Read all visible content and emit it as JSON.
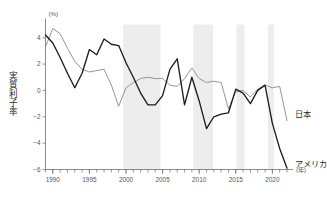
{
  "chart_data": {
    "type": "line",
    "title": "",
    "subtitle": "",
    "xlabel": "(年)",
    "ylabel": "実質利子率",
    "yunit": "(%)",
    "xlim": [
      1989,
      2022
    ],
    "ylim": [
      -6,
      5
    ],
    "yticks": [
      4,
      2,
      0,
      -2,
      -4,
      -6
    ],
    "ytick_labels": [
      "4",
      "2",
      "0",
      "−2",
      "−4",
      "−6"
    ],
    "xticks": [
      1990,
      1995,
      2000,
      2005,
      2010,
      2015,
      2020
    ],
    "xtick_labels": [
      "1990",
      "1995",
      "2000",
      "2005",
      "2010",
      "2015",
      "2020"
    ],
    "grid": false,
    "legend_position": "right-inline",
    "x": [
      1989,
      1990,
      1991,
      1992,
      1993,
      1994,
      1995,
      1996,
      1997,
      1998,
      1999,
      2000,
      2001,
      2002,
      2003,
      2004,
      2005,
      2006,
      2007,
      2008,
      2009,
      2010,
      2011,
      2012,
      2013,
      2014,
      2015,
      2016,
      2017,
      2018,
      2019,
      2020,
      2021,
      2022
    ],
    "series": [
      {
        "name": "日本",
        "label": "日本",
        "color": "#8a8a8a",
        "style": "thin-gray",
        "values": [
          3.3,
          4.7,
          4.3,
          3.2,
          2.2,
          1.6,
          1.4,
          1.5,
          1.6,
          0.4,
          -1.2,
          0.2,
          0.6,
          0.9,
          1.0,
          0.9,
          0.9,
          0.4,
          0.3,
          0.9,
          1.7,
          0.9,
          0.6,
          0.7,
          0.6,
          -1.4,
          -0.1,
          0.0,
          -0.5,
          0.1,
          0.4,
          0.2,
          0.3,
          -2.3
        ]
      },
      {
        "name": "アメリカ",
        "label": "アメリカ",
        "color": "#1d1d1d",
        "style": "thick-black",
        "values": [
          4.2,
          3.6,
          2.5,
          1.3,
          0.2,
          1.3,
          3.1,
          2.7,
          3.9,
          3.5,
          3.4,
          2.1,
          1.0,
          -0.2,
          -1.1,
          -1.1,
          -0.4,
          1.6,
          2.4,
          -1.1,
          1.0,
          -0.8,
          -2.9,
          -2.0,
          -1.8,
          -1.7,
          0.1,
          -0.2,
          -1.0,
          0.0,
          0.4,
          -2.5,
          -4.4,
          -5.9
        ]
      }
    ],
    "recession_bands": [
      {
        "start": 1999.6,
        "end": 2004.7
      },
      {
        "start": 2009.2,
        "end": 2011.9
      },
      {
        "start": 2015.1,
        "end": 2016.2
      },
      {
        "start": 2019.4,
        "end": 2020.2
      }
    ]
  }
}
